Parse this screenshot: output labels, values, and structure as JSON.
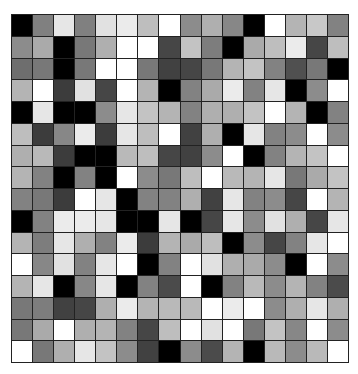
{
  "grid": {
    "rows": 16,
    "cols": 16,
    "border_color": "#222222",
    "values": [
      [
        0,
        128,
        230,
        128,
        225,
        235,
        190,
        255,
        140,
        175,
        135,
        0,
        255,
        180,
        200,
        130
      ],
      [
        140,
        170,
        0,
        120,
        175,
        255,
        255,
        70,
        195,
        125,
        0,
        170,
        190,
        235,
        70,
        190
      ],
      [
        110,
        120,
        0,
        120,
        255,
        255,
        120,
        65,
        70,
        120,
        180,
        195,
        130,
        80,
        120,
        0
      ],
      [
        180,
        255,
        60,
        225,
        70,
        255,
        180,
        0,
        130,
        170,
        235,
        130,
        230,
        0,
        140,
        255
      ],
      [
        0,
        230,
        0,
        0,
        140,
        230,
        195,
        180,
        130,
        175,
        175,
        195,
        255,
        180,
        0,
        130
      ],
      [
        190,
        60,
        135,
        235,
        60,
        230,
        190,
        255,
        65,
        175,
        0,
        230,
        130,
        140,
        255,
        140
      ],
      [
        175,
        185,
        60,
        0,
        0,
        185,
        190,
        70,
        65,
        140,
        255,
        0,
        130,
        180,
        195,
        255
      ],
      [
        180,
        130,
        0,
        130,
        0,
        255,
        140,
        120,
        190,
        255,
        185,
        180,
        230,
        120,
        170,
        195
      ],
      [
        130,
        120,
        60,
        255,
        230,
        0,
        130,
        130,
        175,
        65,
        230,
        130,
        140,
        70,
        255,
        180
      ],
      [
        0,
        130,
        235,
        235,
        230,
        0,
        0,
        230,
        0,
        70,
        230,
        140,
        225,
        175,
        70,
        230
      ],
      [
        180,
        125,
        230,
        175,
        130,
        235,
        60,
        180,
        170,
        190,
        0,
        140,
        70,
        130,
        230,
        255
      ],
      [
        255,
        135,
        225,
        130,
        230,
        255,
        0,
        130,
        255,
        225,
        175,
        170,
        140,
        0,
        255,
        140
      ],
      [
        180,
        230,
        0,
        135,
        230,
        0,
        130,
        75,
        255,
        0,
        130,
        185,
        140,
        180,
        130,
        75
      ],
      [
        120,
        125,
        65,
        70,
        175,
        235,
        180,
        185,
        185,
        255,
        235,
        255,
        140,
        175,
        230,
        175
      ],
      [
        120,
        170,
        255,
        175,
        180,
        130,
        70,
        190,
        255,
        225,
        255,
        120,
        195,
        135,
        255,
        140
      ],
      [
        255,
        120,
        175,
        230,
        195,
        140,
        65,
        0,
        140,
        75,
        180,
        0,
        185,
        140,
        185,
        255
      ]
    ]
  }
}
